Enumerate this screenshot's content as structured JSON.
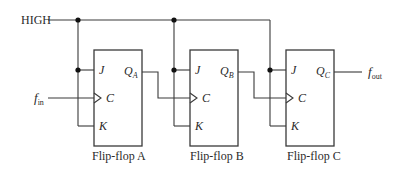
{
  "diagram": {
    "type": "circuit",
    "title": "",
    "inputs": {
      "high_label": "HIGH",
      "clock_in_label": "f",
      "clock_in_sub": "in"
    },
    "output": {
      "label": "f",
      "sub": "out"
    },
    "flip_flops": [
      {
        "name": "Flip-flop A",
        "pins": {
          "j": "J",
          "c": "C",
          "k": "K"
        },
        "q_label": "Q",
        "q_sub": "A"
      },
      {
        "name": "Flip-flop B",
        "pins": {
          "j": "J",
          "c": "C",
          "k": "K"
        },
        "q_label": "Q",
        "q_sub": "B"
      },
      {
        "name": "Flip-flop C",
        "pins": {
          "j": "J",
          "c": "C",
          "k": "K"
        },
        "q_label": "Q",
        "q_sub": "C"
      }
    ],
    "colors": {
      "line": "#3a3a3a",
      "text": "#2a2a2a",
      "background": "#ffffff"
    }
  }
}
